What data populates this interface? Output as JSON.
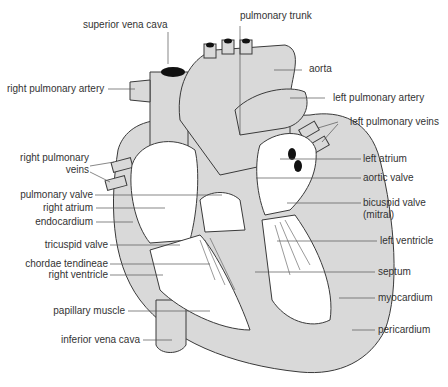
{
  "diagram": {
    "colors": {
      "tissue": "#d9d9d9",
      "outline": "#3a3a3a",
      "chamber": "#ffffff",
      "leader": "#555555",
      "text": "#333333",
      "vessel_lumen": "#111111"
    },
    "labels": {
      "superior_vena_cava": "superior vena cava",
      "pulmonary_trunk": "pulmonary trunk",
      "aorta": "aorta",
      "right_pulmonary_artery": "right pulmonary artery",
      "left_pulmonary_artery": "left pulmonary artery",
      "left_pulmonary_veins": "left pulmonary veins",
      "right_pulmonary_veins_line1": "right pulmonary",
      "right_pulmonary_veins_line2": "veins",
      "left_atrium": "left atrium",
      "pulmonary_valve": "pulmonary valve",
      "aortic_valve": "aortic valve",
      "right_atrium": "right atrium",
      "bicuspid_valve_line1": "bicuspid valve",
      "bicuspid_valve_line2": "(mitral)",
      "endocardium": "endocardium",
      "tricuspid_valve": "tricuspid valve",
      "left_ventricle": "left ventricle",
      "chordae_tendineae": "chordae tendineae",
      "right_ventricle": "right ventricle",
      "septum": "septum",
      "papillary_muscle": "papillary muscle",
      "myocardium": "myocardium",
      "inferior_vena_cava": "inferior vena cava",
      "pericardium": "pericardium"
    }
  }
}
